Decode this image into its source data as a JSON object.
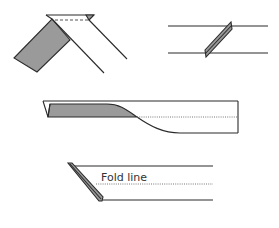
{
  "diagram": {
    "figures": [
      {
        "id": "fig-1",
        "description": "diagonal strip folded over at top with shaded underside"
      },
      {
        "id": "fig-2",
        "description": "strip between two horizontal lines with slanted shaded fold"
      },
      {
        "id": "fig-3",
        "description": "long rectangle with shaded curved fold and dotted center line"
      },
      {
        "id": "fig-4",
        "description": "strip with angled shaded fold and labeled fold line"
      }
    ],
    "labels": {
      "fold_line": "Fold line"
    },
    "colors": {
      "stroke": "#2b2b2b",
      "shade": "#9a9a9a",
      "background": "#ffffff"
    }
  }
}
